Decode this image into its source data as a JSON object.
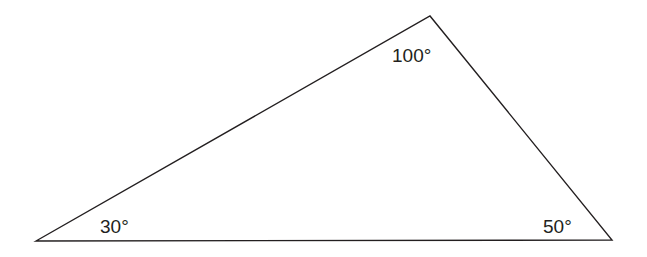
{
  "diagram": {
    "type": "triangle",
    "stroke_color": "#231f20",
    "vertices": {
      "left": {
        "x": 36,
        "y": 241
      },
      "apex": {
        "x": 430,
        "y": 16
      },
      "right": {
        "x": 612,
        "y": 240
      }
    },
    "angles": [
      {
        "vertex": "left",
        "label": "30°",
        "x": 100,
        "y": 233
      },
      {
        "vertex": "apex",
        "label": "100°",
        "x": 392,
        "y": 62
      },
      {
        "vertex": "right",
        "label": "50°",
        "x": 543,
        "y": 233
      }
    ]
  }
}
